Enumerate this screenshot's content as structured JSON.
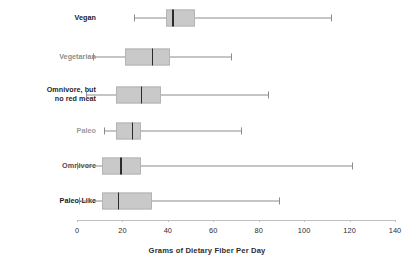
{
  "chart_data": {
    "type": "box",
    "title": "",
    "xlabel": "Grams of Dietary Fiber Per Day",
    "ylabel": "",
    "xlim": [
      0,
      140
    ],
    "xticks": [
      0,
      20,
      40,
      60,
      80,
      100,
      120,
      140
    ],
    "xtick_labels": [
      "0",
      "20",
      "40",
      "60",
      "80",
      "100",
      "120",
      "140"
    ],
    "grid": false,
    "legend": "none",
    "orientation": "horizontal",
    "categories": [
      "Vegan",
      "Vegetarian",
      "Omnivore, but\nno red meat",
      "Paleo",
      "Omnivore",
      "Paleo-Like"
    ],
    "boxes": [
      {
        "label": "Vegan",
        "min": 25,
        "q1": 39,
        "median": 42,
        "q3": 52,
        "max": 112
      },
      {
        "label": "Vegetarian",
        "min": 7,
        "q1": 21,
        "median": 33,
        "q3": 41,
        "max": 68
      },
      {
        "label": "Omnivore, but\nno red meat",
        "min": 4,
        "q1": 17,
        "median": 28,
        "q3": 37,
        "max": 84
      },
      {
        "label": "Paleo",
        "min": 12,
        "q1": 17,
        "median": 24,
        "q3": 28,
        "max": 72
      },
      {
        "label": "Omnivore",
        "min": 0,
        "q1": 11,
        "median": 19,
        "q3": 28,
        "max": 121
      },
      {
        "label": "Paleo-Like",
        "min": 1,
        "q1": 11,
        "median": 18,
        "q3": 33,
        "max": 89
      }
    ],
    "colors": {
      "box_fill": "#c9c9c9",
      "box_edge": "#b4b4b4",
      "median": "#2b2b2b",
      "whisker": "#8c8c8c",
      "axis": "#c0c0c0",
      "text": "#2e2e2e",
      "background": "#ffffff"
    }
  },
  "layout": {
    "plot_x0_px": 77,
    "plot_x140_px": 395,
    "row_y_px": [
      18,
      57,
      95,
      131,
      166,
      201
    ],
    "axis_y_px": 220,
    "box_height_px": 17,
    "tick_label_y_px": 226,
    "axis_title_y_px": 246
  }
}
